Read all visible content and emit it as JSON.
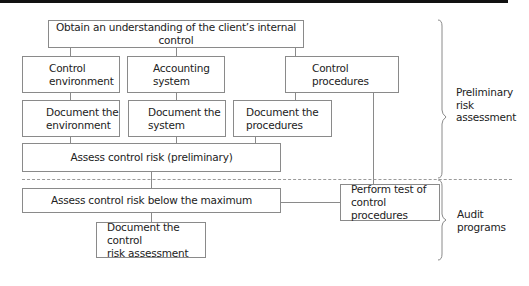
{
  "diagram": {
    "boxes": {
      "understand": {
        "text": "Obtain an understanding of the client’s internal control"
      },
      "control_env": {
        "line1": "Control",
        "line2": "environment"
      },
      "accounting_sys": {
        "line1": "Accounting",
        "line2": "system"
      },
      "control_proc": {
        "line1": "Control",
        "line2": "procedures"
      },
      "doc_env": {
        "line1": "Document the",
        "line2": "environment"
      },
      "doc_sys": {
        "line1": "Document the",
        "line2": "system"
      },
      "doc_proc": {
        "line1": "Document the",
        "line2": "procedures"
      },
      "assess_prelim": {
        "text": "Assess control risk (preliminary)"
      },
      "assess_below": {
        "text": "Assess control risk below the maximum"
      },
      "doc_risk": {
        "line1": "Document the control",
        "line2": "risk assessment"
      },
      "perform_test": {
        "line1": "Perform test of",
        "line2": "control procedures"
      }
    },
    "phases": [
      {
        "line1": "Preliminary",
        "line2": "risk",
        "line3": "assessment"
      },
      {
        "line1": "Audit",
        "line2": "programs"
      }
    ]
  }
}
